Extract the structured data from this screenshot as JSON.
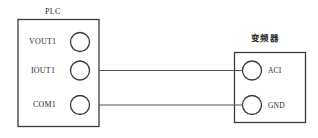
{
  "diagram": {
    "type": "wiring-connection-diagram",
    "canvas": {
      "width": 318,
      "height": 138,
      "background": "#ffffff"
    },
    "stroke_color": "#3a3a3a",
    "wire_color": "#555555",
    "text_color": "#2b2b2b"
  },
  "plc": {
    "title": "PLC",
    "terminals": [
      {
        "id": "vout1",
        "label": "VOUT1",
        "connected": false
      },
      {
        "id": "iout1",
        "label": "IOUT1",
        "connected": true
      },
      {
        "id": "com1",
        "label": "COM1",
        "connected": true
      }
    ]
  },
  "inverter": {
    "title": "变频器",
    "terminals": [
      {
        "id": "aci",
        "label": "ACI",
        "connected": true
      },
      {
        "id": "gnd",
        "label": "GND",
        "connected": true
      }
    ]
  },
  "wires": [
    {
      "id": "wire-iout1-aci",
      "from": "iout1",
      "to": "aci"
    },
    {
      "id": "wire-com1-gnd",
      "from": "com1",
      "to": "gnd"
    }
  ]
}
